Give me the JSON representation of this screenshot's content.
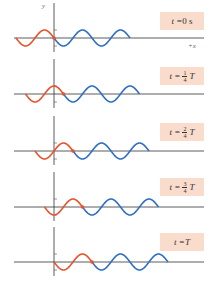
{
  "diagram": {
    "title": "",
    "axis": {
      "y_label": "y",
      "x_label": "+x"
    },
    "colors": {
      "trailing_wave": "#e8532b",
      "leading_wave": "#2f6fc4",
      "axis": "#333333",
      "label_bg": "#f9dccb"
    },
    "geometry": {
      "y_axis_x": 54,
      "wavelength_px": 38,
      "amplitude_px": 8
    },
    "panels": [
      {
        "time_prefix": "t = ",
        "time_value": "0 s",
        "frac_num": "",
        "frac_den": "",
        "suffix": "",
        "baseline_y": 38,
        "label_top": 12,
        "shift_quarters": 0
      },
      {
        "time_prefix": "t = ",
        "time_value": "",
        "frac_num": "1",
        "frac_den": "4",
        "suffix": "T",
        "baseline_y": 94,
        "label_top": 67,
        "shift_quarters": 1
      },
      {
        "time_prefix": "t = ",
        "time_value": "",
        "frac_num": "2",
        "frac_den": "4",
        "suffix": "T",
        "baseline_y": 151,
        "label_top": 123,
        "shift_quarters": 2
      },
      {
        "time_prefix": "t = ",
        "time_value": "",
        "frac_num": "3",
        "frac_den": "4",
        "suffix": "T",
        "baseline_y": 207,
        "label_top": 178,
        "shift_quarters": 3
      },
      {
        "time_prefix": "t = ",
        "time_value": "T",
        "frac_num": "",
        "frac_den": "",
        "suffix": "",
        "baseline_y": 262,
        "label_top": 233,
        "shift_quarters": 4
      }
    ]
  }
}
